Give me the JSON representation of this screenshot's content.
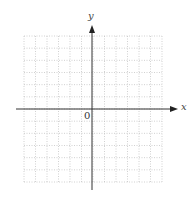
{
  "diagram": {
    "type": "coordinate-grid",
    "x_axis_label": "x",
    "y_axis_label": "y",
    "origin_label": "0",
    "grid": {
      "columns": 12,
      "rows": 12,
      "line_style": "dotted"
    },
    "colors": {
      "axis": "#333333",
      "grid": "#bdbdbd",
      "background": "#ffffff"
    }
  }
}
